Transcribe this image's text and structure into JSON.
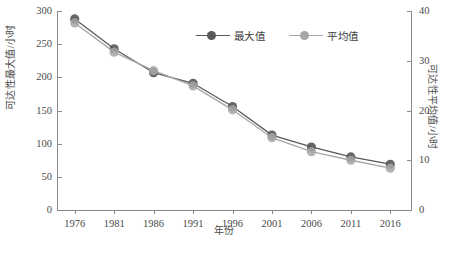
{
  "chart_data": {
    "type": "line",
    "title": "",
    "xlabel": "年份",
    "ylabel": "可达性最大值/小时",
    "ylabel_right": "可达性平均值/小时",
    "categories": [
      "1976",
      "1981",
      "1986",
      "1991",
      "1996",
      "2001",
      "2006",
      "2011",
      "2016"
    ],
    "x": [
      1976,
      1981,
      1986,
      1991,
      1996,
      2001,
      2006,
      2011,
      2016
    ],
    "ylim": [
      0,
      300
    ],
    "ylim_right": [
      0,
      40
    ],
    "yticks": [
      0,
      50,
      100,
      150,
      200,
      250,
      300
    ],
    "yticks_right": [
      0,
      10,
      20,
      30,
      40
    ],
    "grid": false,
    "legend_position": "top-center",
    "series": [
      {
        "name": "最大值",
        "axis": "left",
        "color": "#595959",
        "values": [
          288,
          243,
          207,
          191,
          156,
          113,
          95,
          80,
          69
        ]
      },
      {
        "name": "平均值",
        "axis": "right",
        "color": "#a6a6a6",
        "values_left_scale": [
          282,
          238,
          210,
          187,
          151,
          109,
          88,
          75,
          63
        ],
        "values": [
          37.6,
          31.7,
          28.0,
          24.9,
          20.1,
          14.5,
          11.7,
          10.0,
          8.4
        ]
      }
    ]
  },
  "axes": {
    "left": {
      "title": "可达性最大值/小时",
      "ticks": [
        "300",
        "250",
        "200",
        "150",
        "100",
        "50",
        "0"
      ]
    },
    "right": {
      "title": "可达性平均值/小时",
      "ticks": [
        "40",
        "30",
        "20",
        "10",
        "0"
      ]
    },
    "bottom": {
      "title": "年份",
      "ticks": [
        "1976",
        "1981",
        "1986",
        "1991",
        "1996",
        "2001",
        "2006",
        "2011",
        "2016"
      ]
    }
  },
  "legend": {
    "entries": [
      {
        "label": "最大值",
        "color": "#595959"
      },
      {
        "label": "平均值",
        "color": "#a6a6a6"
      }
    ]
  },
  "caption": {
    "text": ""
  }
}
